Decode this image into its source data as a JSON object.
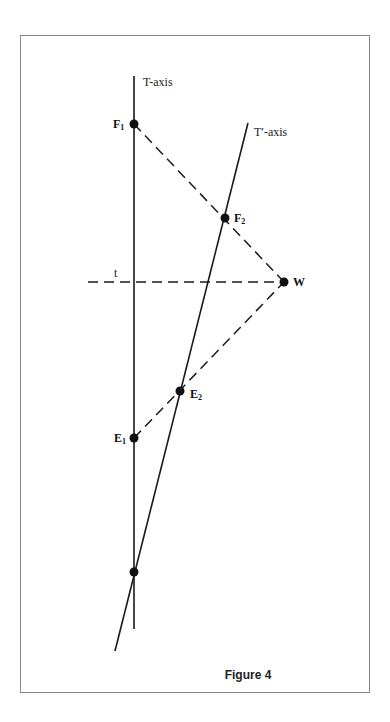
{
  "figure": {
    "caption": "Figure 4",
    "axes": {
      "t_axis_label": "T-axis",
      "t_prime_axis_label": "T′-axis",
      "t_line_label": "t"
    },
    "points": [
      {
        "id": "F1",
        "label": "F",
        "subscript": "1"
      },
      {
        "id": "F2",
        "label": "F",
        "subscript": "2"
      },
      {
        "id": "W",
        "label": "W",
        "subscript": ""
      },
      {
        "id": "E2",
        "label": "E",
        "subscript": "2"
      },
      {
        "id": "E1",
        "label": "E",
        "subscript": "1"
      },
      {
        "id": "O",
        "label": "",
        "subscript": ""
      }
    ],
    "colors": {
      "line": "#1a1a1a",
      "frame": "#8a8a8a"
    }
  }
}
